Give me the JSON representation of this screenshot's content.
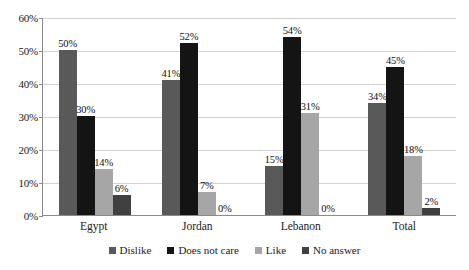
{
  "chart_data": {
    "type": "bar",
    "title": "",
    "xlabel": "",
    "ylabel": "",
    "categories": [
      "Egypt",
      "Jordan",
      "Lebanon",
      "Total"
    ],
    "series": [
      {
        "name": "Dislike",
        "color": "#595959",
        "values": [
          50,
          41,
          15,
          34
        ],
        "labels": [
          "50%",
          "41%",
          "15%",
          "34%"
        ]
      },
      {
        "name": "Does not care",
        "color": "#141414",
        "values": [
          30,
          52,
          54,
          45
        ],
        "labels": [
          "30%",
          "52%",
          "54%",
          "45%"
        ]
      },
      {
        "name": "Like",
        "color": "#a6a6a6",
        "values": [
          14,
          7,
          31,
          18
        ],
        "labels": [
          "14%",
          "7%",
          "31%",
          "18%"
        ]
      },
      {
        "name": "No answer",
        "color": "#404040",
        "values": [
          6,
          0,
          0,
          2
        ],
        "labels": [
          "6%",
          "0%",
          "0%",
          "2%"
        ]
      }
    ],
    "ylim": [
      0,
      60
    ],
    "yticks": [
      0,
      10,
      20,
      30,
      40,
      50,
      60
    ],
    "ytick_labels": [
      "0%",
      "10%",
      "20%",
      "30%",
      "40%",
      "50%",
      "60%"
    ],
    "grid": true,
    "legend_position": "bottom",
    "value_suffix": "%"
  }
}
